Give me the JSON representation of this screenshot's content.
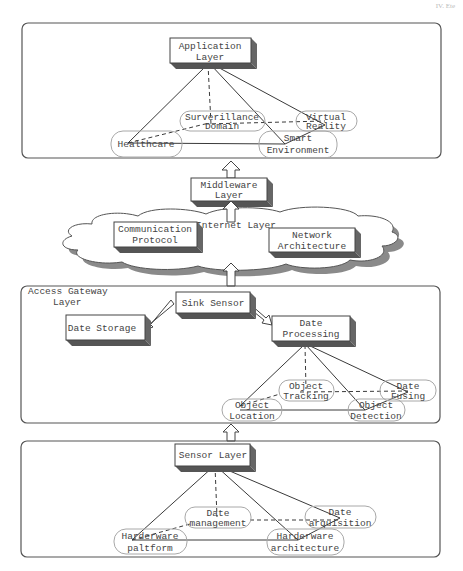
{
  "corner_label": "IV. Ete",
  "colors": {
    "panel_border": "#555555",
    "box_fill": "#ffffff",
    "box_side": "#666666",
    "box_bottom": "#555555",
    "ellipse_border": "#a8a8a8",
    "line": "#3a3a3a",
    "cloud_shadow": "#8a8a8a"
  },
  "application_panel": {
    "title": [
      "Application",
      "Layer"
    ],
    "nodes": [
      {
        "id": "surveillance",
        "lines": [
          "Surverillance",
          "Domain"
        ]
      },
      {
        "id": "virtual-reality",
        "lines": [
          "Virtual",
          "Reality"
        ]
      },
      {
        "id": "healthcare",
        "lines": [
          "Healthcare"
        ]
      },
      {
        "id": "smart-environment",
        "lines": [
          "Smart",
          "Environment"
        ]
      }
    ]
  },
  "middleware": {
    "title": [
      "Middleware",
      "Layer"
    ]
  },
  "internet_layer": {
    "label": "Internet Layer",
    "boxes": [
      {
        "id": "communication-protocol",
        "lines": [
          "Communication",
          "Protocol"
        ]
      },
      {
        "id": "network-architecture",
        "lines": [
          "Network",
          "Architecture"
        ]
      }
    ]
  },
  "access_panel": {
    "label": [
      "Access Gateway",
      "Layer"
    ],
    "sink": "Sink Sensor",
    "storage": "Date Storage",
    "processing": [
      "Date",
      "Processing"
    ],
    "nodes": [
      {
        "id": "object-tracking",
        "lines": [
          "Object",
          "Tracking"
        ]
      },
      {
        "id": "date-fusing",
        "lines": [
          "Date",
          "Fusing"
        ]
      },
      {
        "id": "object-location",
        "lines": [
          "Object",
          "Location"
        ]
      },
      {
        "id": "object-detection",
        "lines": [
          "Object",
          "Detection"
        ]
      }
    ]
  },
  "sensor_panel": {
    "title": "Sensor Layer",
    "nodes": [
      {
        "id": "date-management",
        "lines": [
          "Date",
          "management"
        ]
      },
      {
        "id": "date-arquisition",
        "lines": [
          "Date",
          "arquisition"
        ]
      },
      {
        "id": "hardware-platform",
        "lines": [
          "Harderware",
          "paltform"
        ]
      },
      {
        "id": "hardware-architecture",
        "lines": [
          "Harderware",
          "architecture"
        ]
      }
    ]
  }
}
